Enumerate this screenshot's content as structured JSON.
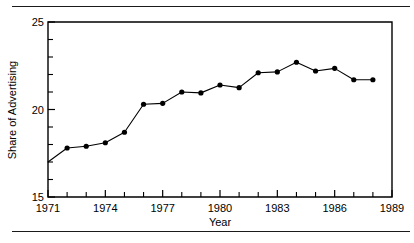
{
  "figure": {
    "rule_color": "#1a1a1a",
    "has_top_rule": true,
    "has_bottom_rule": true
  },
  "chart_data": {
    "type": "line",
    "title": "",
    "xlabel": "Year",
    "ylabel": "Share of Advertising",
    "xlim": [
      1971,
      1989
    ],
    "ylim": [
      15,
      25
    ],
    "grid": false,
    "legend": "none",
    "marker": "filled-circle",
    "line_color": "#000000",
    "marker_color": "#000000",
    "x_major_ticks": [
      1971,
      1974,
      1977,
      1980,
      1983,
      1986,
      1989
    ],
    "x_major_tick_labels": [
      "1971",
      "1974",
      "1977",
      "1980",
      "1983",
      "1986",
      "1989"
    ],
    "x_minor_ticks": [
      1972,
      1973,
      1975,
      1976,
      1978,
      1979,
      1981,
      1982,
      1984,
      1985,
      1987,
      1988
    ],
    "y_major_ticks": [
      15,
      20,
      25
    ],
    "y_major_tick_labels": [
      "15",
      "20",
      "25"
    ],
    "y_minor_ticks": [
      16,
      17,
      18,
      19,
      21,
      22,
      23,
      24
    ],
    "x": [
      1971,
      1972,
      1973,
      1974,
      1975,
      1976,
      1977,
      1978,
      1979,
      1980,
      1981,
      1982,
      1983,
      1984,
      1985,
      1986,
      1987,
      1988
    ],
    "values": [
      17.0,
      17.8,
      17.9,
      18.1,
      18.7,
      20.3,
      20.35,
      21.0,
      20.95,
      21.4,
      21.25,
      22.1,
      22.15,
      22.7,
      22.2,
      22.35,
      21.7,
      21.7
    ],
    "series": [
      {
        "name": "Share of Advertising",
        "values": [
          17.0,
          17.8,
          17.9,
          18.1,
          18.7,
          20.3,
          20.35,
          21.0,
          20.95,
          21.4,
          21.25,
          22.1,
          22.15,
          22.7,
          22.2,
          22.35,
          21.7,
          21.7
        ]
      }
    ]
  }
}
